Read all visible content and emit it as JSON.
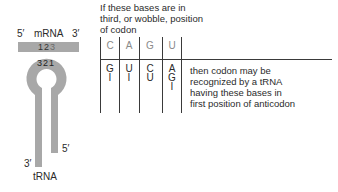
{
  "mrna": {
    "five_prime": "5′",
    "label": "mRNA",
    "three_prime": "3′",
    "codon_positions": [
      "1",
      "2",
      "3"
    ]
  },
  "trna": {
    "anticodon_positions": [
      "3",
      "2",
      "1"
    ],
    "five_prime": "5′",
    "three_prime": "3′",
    "label": "tRNA"
  },
  "caption_top": [
    "If these bases are in",
    "third, or wobble, position",
    "of codon"
  ],
  "table": {
    "headers": [
      "C",
      "A",
      "G",
      "U"
    ],
    "columns": [
      [
        "G",
        "I"
      ],
      [
        "U",
        "I"
      ],
      [
        "C",
        "U"
      ],
      [
        "A",
        "G",
        "I"
      ]
    ]
  },
  "caption_right": [
    "then codon may be",
    "recognized by a tRNA",
    "having these bases in",
    "first position of anticodon"
  ],
  "colors": {
    "rna_gray": "#a8a8a8",
    "line": "#3a3a3a",
    "header_text": "#8a8a8a"
  }
}
